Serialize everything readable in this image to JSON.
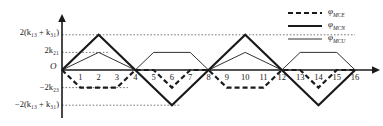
{
  "figure": {
    "origin_label": "O",
    "y_axis_labels": [
      {
        "id": "pos_high",
        "text": "2(k₁₃ + k₃₁)",
        "value": "2(k13+k31)"
      },
      {
        "id": "pos_low",
        "text": "2k₂₁",
        "value": "2k21"
      },
      {
        "id": "neg_low",
        "text": "−2k₂₃",
        "value": "-2k23"
      },
      {
        "id": "neg_high",
        "text": "−2(k₁₃ + k₃₁)",
        "value": "-2(k13+k31)"
      }
    ],
    "x_ticks": [
      "1",
      "2",
      "3",
      "4",
      "5",
      "6",
      "7",
      "8",
      "9",
      "10",
      "11",
      "12",
      "13",
      "14",
      "15",
      "16"
    ],
    "legend": [
      {
        "id": "mce",
        "label": "φ",
        "sub": "MCE",
        "style": "dashed",
        "width": 2.2
      },
      {
        "id": "mcn",
        "label": "φ",
        "sub": "MCN",
        "style": "solid",
        "width": 2.2
      },
      {
        "id": "mcu",
        "label": "φ",
        "sub": "MCU",
        "style": "solid",
        "width": 0.9
      }
    ],
    "colors": {
      "ink": "#1a1a1a",
      "grid": "#555555",
      "axis": "#1a1a1a"
    }
  },
  "chart_data": {
    "type": "line",
    "title": "",
    "xlabel": "",
    "ylabel": "",
    "xlim": [
      0,
      16
    ],
    "ylim": [
      -2,
      2
    ],
    "grid": "horizontal-dotted-guidelines",
    "legend_position": "top-right",
    "y_levels": {
      "2(k13+k31)": 2,
      "2k21": 1,
      "0": 0,
      "-2k23": -1,
      "-2(k13+k31)": -2
    },
    "series": [
      {
        "name": "φMCE",
        "style": "dashed",
        "points_x": [
          0,
          1,
          3,
          4,
          5,
          6,
          7,
          8,
          9,
          11,
          12,
          13,
          14,
          15,
          16
        ],
        "points_y": [
          0,
          -1,
          -1,
          0,
          0,
          -1,
          0,
          0,
          -1,
          -1,
          0,
          0,
          -1,
          0,
          0
        ]
      },
      {
        "name": "φMCN",
        "style": "solid-thick",
        "points_x": [
          0,
          2,
          4,
          6,
          8,
          10,
          12,
          14,
          16
        ],
        "points_y": [
          0,
          2,
          0,
          -2,
          0,
          2,
          0,
          -2,
          0
        ]
      },
      {
        "name": "φMCU",
        "style": "solid-thin",
        "points_x": [
          0,
          2,
          4,
          5,
          7,
          8,
          10,
          12,
          13,
          15,
          16
        ],
        "points_y": [
          0,
          1,
          0,
          1,
          1,
          0,
          1,
          0,
          1,
          1,
          0
        ]
      }
    ]
  }
}
